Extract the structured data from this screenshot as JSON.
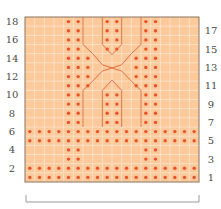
{
  "chart_data": {
    "type": "grid",
    "title": "",
    "columns": 18,
    "rows": 18,
    "colors": {
      "background": "#fbc99a",
      "grid_line": "#fde6cf",
      "border": "#8a7460",
      "dot": "#e8532a",
      "cable_line": "#d9683a",
      "label": "#4a4a4a",
      "bracket": "#9a9a9a"
    },
    "left_row_labels": [
      "18",
      "16",
      "14",
      "12",
      "10",
      "8",
      "6",
      "4",
      "2"
    ],
    "right_row_labels": [
      "17",
      "15",
      "13",
      "11",
      "9",
      "7",
      "5",
      "3",
      "1"
    ],
    "purl_dots": {
      "note": "row numbers 1-18 bottom to top; column indices 0-17 left to right",
      "rows": {
        "1": [
          0,
          1,
          2,
          3,
          4,
          5,
          6,
          7,
          8,
          9,
          10,
          11,
          12,
          13,
          14,
          15,
          16,
          17
        ],
        "2": [
          0,
          1,
          2,
          3,
          4,
          5,
          6,
          7,
          8,
          9,
          10,
          11,
          12,
          13,
          14,
          15,
          16,
          17
        ],
        "3": [
          4,
          5,
          12,
          13
        ],
        "4": [
          4,
          5,
          12,
          13
        ],
        "5": [
          0,
          1,
          2,
          3,
          4,
          5,
          6,
          7,
          8,
          9,
          10,
          11,
          12,
          13,
          14,
          15,
          16,
          17
        ],
        "6": [
          0,
          1,
          2,
          3,
          4,
          5,
          6,
          7,
          8,
          9,
          10,
          11,
          12,
          13,
          14,
          15,
          16,
          17
        ],
        "7": [
          4,
          5,
          8,
          9,
          12,
          13
        ],
        "8": [
          4,
          5,
          8,
          9,
          12,
          13
        ],
        "9": [
          4,
          5,
          8,
          9,
          12,
          13
        ],
        "10": [
          4,
          5,
          8,
          9,
          12,
          13
        ],
        "11": [
          4,
          5,
          6,
          11,
          12,
          13
        ],
        "12": [
          4,
          5,
          6,
          11,
          12,
          13
        ],
        "13": [
          4,
          5,
          6,
          11,
          12,
          13
        ],
        "14": [
          4,
          5,
          6,
          11,
          12,
          13
        ],
        "15": [
          4,
          5,
          8,
          9,
          12,
          13
        ],
        "16": [
          4,
          5,
          8,
          9,
          12,
          13
        ],
        "17": [
          4,
          5,
          8,
          9,
          12,
          13
        ],
        "18": [
          4,
          5,
          8,
          9,
          12,
          13
        ]
      }
    },
    "bracket": "full-width repeat bracket below chart"
  }
}
